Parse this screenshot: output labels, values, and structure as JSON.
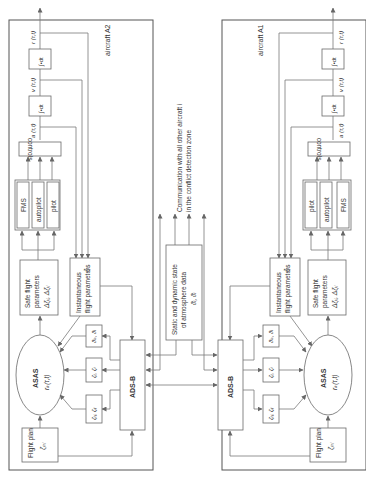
{
  "diagram": {
    "orientation": "rotated 90° counter-clockwise",
    "center": {
      "communication_line1": "Communication with all other aircraft i",
      "communication_line2": "in the conflict detection zone",
      "atmosphere_line1": "Static and dynamic state",
      "atmosphere_line2": "of atmosphere data",
      "atmosphere_symbols": "ϑᵢ, ϑᵢ"
    },
    "aircraft_left": {
      "frame_label": "aircraft A2",
      "outputs": {
        "position": "r (τ,t)",
        "velocity": "v (τ,t)",
        "acceleration": "a (τ,t)"
      },
      "integrator_1": "∫•dt",
      "integrator_2": "∫•dt",
      "controls": "controls",
      "fms": "FMS",
      "autopilot": "autopilot",
      "pilot": "pilot",
      "safe_params_line1": "Safe flight",
      "safe_params_line2": "parameters",
      "safe_params_line3": "Δζᵢⱼ, Δζᵢⱼ",
      "inst_params_line1": "Instantaneous",
      "inst_params_line2": "flight parameters",
      "inst_params_sym": "ζᵢⱼ",
      "asas_label": "ASAS",
      "asas_sym": "rₖ(τ,t)",
      "adsb": "ADS-B",
      "theta_box": "ϑₒ, ϑᵢ",
      "zeta_box_1": "ζᵢ, ζᵢ",
      "zeta_box_2": "ζᵢⱼ, ζᵢⱼ",
      "flight_plan_line1": "Flight plan",
      "flight_plan_sym": "ζₚⱼ"
    },
    "aircraft_right": {
      "frame_label": "aircraft A1",
      "outputs": {
        "position": "r (τ,t)",
        "velocity": "v (τ,t)",
        "acceleration": "a (τ,t)"
      },
      "integrator_1": "∫•dt",
      "integrator_2": "∫•dt",
      "controls": "controls",
      "fms": "FMS",
      "autopilot": "autopilot",
      "pilot": "pilot",
      "safe_params_line1": "Safe flight",
      "safe_params_line2": "parameters",
      "safe_params_line3": "Δζᵢⱼ, Δζᵢⱼ",
      "inst_params_line1": "Instantaneous",
      "inst_params_line2": "flight parameters",
      "inst_params_sym": "ζᵢⱼ",
      "asas_label": "ASAS",
      "asas_sym": "rₖ(τ,t)",
      "adsb": "ADS-B",
      "theta_box": "ϑₒ, ϑᵢ",
      "zeta_box_1": "ζᵢ, ζᵢ",
      "zeta_box_2": "ζᵢⱼ, ζᵢⱼ",
      "flight_plan_line1": "Flight plan",
      "flight_plan_sym": "ζₚⱼ"
    }
  }
}
